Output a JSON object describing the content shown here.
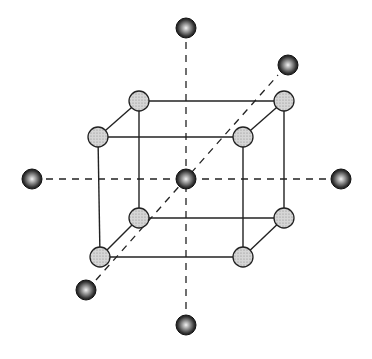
{
  "diagram": {
    "title": "",
    "colors": {
      "background": "#ffffff",
      "line": "#222222",
      "cube_atom_fill": "#c8c8c8",
      "outer_atom_fill": "#2a2a2a",
      "highlight": "#e8e8e8"
    },
    "cube_atoms": [
      {
        "id": "front-top-left",
        "x": 98,
        "y": 137
      },
      {
        "id": "front-top-right",
        "x": 243,
        "y": 137
      },
      {
        "id": "front-bottom-left",
        "x": 100,
        "y": 257
      },
      {
        "id": "front-bottom-right",
        "x": 243,
        "y": 257
      },
      {
        "id": "back-top-left",
        "x": 139,
        "y": 101
      },
      {
        "id": "back-top-right",
        "x": 284,
        "y": 101
      },
      {
        "id": "back-bottom-left",
        "x": 139,
        "y": 218
      },
      {
        "id": "back-bottom-right",
        "x": 284,
        "y": 218
      }
    ],
    "center_atom": {
      "id": "center",
      "x": 186,
      "y": 179
    },
    "outer_atoms": [
      {
        "id": "top",
        "x": 186,
        "y": 28
      },
      {
        "id": "bottom",
        "x": 186,
        "y": 325
      },
      {
        "id": "left",
        "x": 32,
        "y": 179
      },
      {
        "id": "right",
        "x": 341,
        "y": 179
      },
      {
        "id": "upper-right",
        "x": 288,
        "y": 65
      },
      {
        "id": "lower-left",
        "x": 86,
        "y": 290
      }
    ]
  }
}
